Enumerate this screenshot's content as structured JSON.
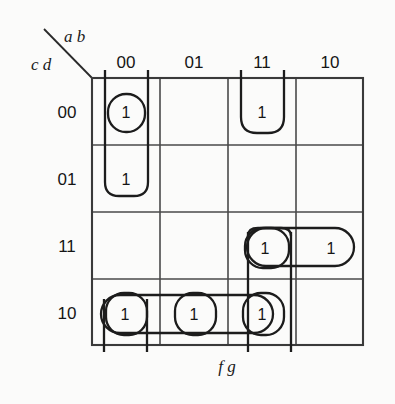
{
  "diagram": {
    "type": "karnaugh-map",
    "variables_top": "a b",
    "variables_left": "c d",
    "variables_bottom": "f g",
    "column_headers": [
      "00",
      "01",
      "11",
      "10"
    ],
    "row_headers": [
      "00",
      "01",
      "11",
      "10"
    ],
    "cells": [
      {
        "row": "00",
        "col": "00",
        "value": "1"
      },
      {
        "row": "00",
        "col": "11",
        "value": "1"
      },
      {
        "row": "01",
        "col": "00",
        "value": "1"
      },
      {
        "row": "11",
        "col": "11",
        "value": "1"
      },
      {
        "row": "11",
        "col": "10",
        "value": "1"
      },
      {
        "row": "10",
        "col": "00",
        "value": "1"
      },
      {
        "row": "10",
        "col": "01",
        "value": "1"
      },
      {
        "row": "10",
        "col": "11",
        "value": "1"
      }
    ],
    "colors": {
      "background": "#fbfbfa",
      "grid": "#4a4a4a",
      "loop": "#1c1c1c",
      "text": "#151515"
    }
  }
}
